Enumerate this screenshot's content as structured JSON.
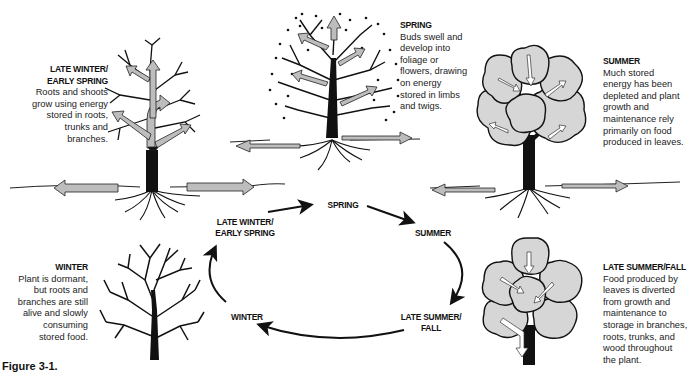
{
  "figure": {
    "caption": "Figure 3-1.",
    "colors": {
      "ink": "#111111",
      "arrow_fill": "#bdbdbd",
      "foliage_fill": "#d6d6d6",
      "background": "#ffffff"
    }
  },
  "stages": [
    {
      "id": "late-winter-early-spring",
      "heading_line1": "LATE WINTER/",
      "heading_line2": "EARLY SPRING",
      "lines": [
        "Roots and shoots",
        "grow using energy",
        "stored in roots,",
        "trunks and",
        "branches."
      ]
    },
    {
      "id": "spring",
      "heading": "SPRING",
      "lines": [
        "Buds swell and",
        "develop into",
        "foliage or",
        "flowers, drawing",
        "on energy",
        "stored in limbs",
        "and twigs."
      ]
    },
    {
      "id": "summer",
      "heading": "SUMMER",
      "lines": [
        "Much stored",
        "energy has been",
        "depleted and plant",
        "growth and",
        "maintenance rely",
        "primarily on food",
        "produced in leaves."
      ]
    },
    {
      "id": "winter",
      "heading": "WINTER",
      "lines": [
        "Plant is dormant,",
        "but roots and",
        "branches are still",
        "alive and slowly",
        "consuming",
        "stored food."
      ]
    },
    {
      "id": "late-summer-fall",
      "heading": "LATE SUMMER/FALL",
      "lines": [
        "Food produced by",
        "leaves is diverted",
        "from growth and",
        "maintenance to",
        "storage in branches,",
        "roots, trunks, and",
        "wood throughout",
        "the plant."
      ]
    }
  ],
  "cycle": {
    "spring": "SPRING",
    "summer": "SUMMER",
    "late_summer_line1": "LATE SUMMER/",
    "late_summer_line2": "FALL",
    "winter": "WINTER",
    "late_winter_line1": "LATE WINTER/",
    "late_winter_line2": "EARLY SPRING",
    "direction": "clockwise"
  }
}
